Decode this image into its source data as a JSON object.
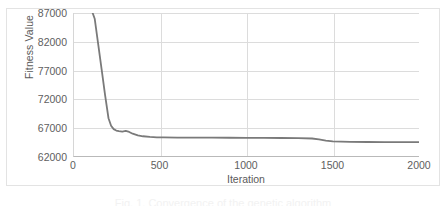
{
  "chart_data": {
    "type": "line",
    "title": "",
    "xlabel": "Iteration",
    "ylabel": "Fitness Value",
    "xlim": [
      0,
      2000
    ],
    "ylim": [
      62000,
      87000
    ],
    "xticks": [
      0,
      500,
      1000,
      1500,
      2000
    ],
    "yticks": [
      62000,
      67000,
      72000,
      77000,
      82000,
      87000
    ],
    "xtick_labels": [
      "0",
      "500",
      "1000",
      "1500",
      "2000"
    ],
    "ytick_labels": [
      "62000",
      "67000",
      "72000",
      "77000",
      "82000",
      "87000"
    ],
    "grid": true,
    "legend": false,
    "legend_position": "none",
    "line_color": "#7a7a7a",
    "grid_color": "#dcdcdc",
    "axis_color": "#b9b9b9",
    "text_color": "#5e5e5e",
    "series": [
      {
        "name": "Fitness Value",
        "x": [
          100,
          120,
          140,
          160,
          180,
          200,
          215,
          230,
          245,
          260,
          280,
          300,
          320,
          340,
          370,
          400,
          440,
          480,
          520,
          600,
          700,
          800,
          900,
          1000,
          1100,
          1200,
          1300,
          1380,
          1420,
          1460,
          1500,
          1600,
          1700,
          1800,
          1900,
          2000
        ],
        "y": [
          90100,
          86000,
          81600,
          77200,
          72700,
          68600,
          67300,
          66700,
          66450,
          66350,
          66280,
          66380,
          66200,
          65900,
          65600,
          65450,
          65330,
          65270,
          65240,
          65220,
          65210,
          65200,
          65190,
          65180,
          65170,
          65150,
          65120,
          65060,
          64900,
          64700,
          64560,
          64480,
          64450,
          64430,
          64420,
          64410
        ]
      }
    ]
  },
  "axes": {
    "y_title": "Fitness Value",
    "x_title": "Iteration"
  },
  "caption": {
    "text": "Fig. 1. Convergence of the genetic algorithm"
  }
}
